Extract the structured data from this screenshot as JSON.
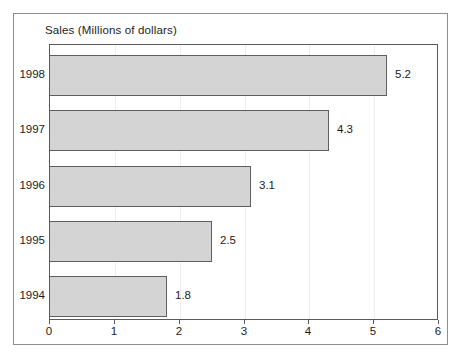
{
  "chart_data": {
    "type": "bar",
    "orientation": "horizontal",
    "title": "Sales (Millions of dollars)",
    "xlabel": "",
    "ylabel": "",
    "categories": [
      "1998",
      "1997",
      "1996",
      "1995",
      "1994"
    ],
    "values": [
      5.2,
      4.3,
      3.1,
      2.5,
      1.8
    ],
    "value_labels": [
      "5.2",
      "4.3",
      "3.1",
      "2.5",
      "1.8"
    ],
    "xlim": [
      0,
      6
    ],
    "xticks": [
      0,
      1,
      2,
      3,
      4,
      5,
      6
    ],
    "xtick_labels": [
      "0",
      "1",
      "2",
      "3",
      "4",
      "5",
      "6"
    ],
    "grid": true,
    "grid_axis": "x",
    "legend": false,
    "bar_fill_color": "#d4d4d4",
    "bar_edge_color": "#5e5e5e",
    "plot_border_color": "#5a5a5a",
    "gridline_color": "#ededed",
    "frame_color": "#8e8e8e",
    "background_color": "#ffffff",
    "text_color": "#1c1c1c"
  }
}
